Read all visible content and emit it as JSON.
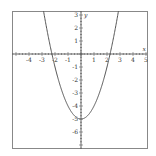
{
  "chart_data": {
    "type": "line",
    "title": "",
    "function": "y = x^2 - 5",
    "xlabel": "x",
    "ylabel": "y",
    "xlim": [
      -5.3,
      5.2
    ],
    "ylim": [
      -7.3,
      3.3
    ],
    "x_ticks": [
      "-4",
      "-3",
      "-2",
      "-1",
      "1",
      "2",
      "3",
      "4",
      "5"
    ],
    "y_ticks": [
      "3",
      "2",
      "1",
      "-1",
      "-2",
      "-3",
      "-4",
      "-5",
      "-6"
    ],
    "grid": false,
    "series": [
      {
        "name": "parabola",
        "x": [
          -2.83,
          -2.5,
          -2,
          -1.5,
          -1,
          -0.5,
          0,
          0.5,
          1,
          1.5,
          2,
          2.5,
          2.83
        ],
        "values": [
          3,
          1.25,
          -1,
          -2.75,
          -4,
          -4.75,
          -5,
          -4.75,
          -4,
          -2.75,
          -1,
          1.25,
          3
        ]
      }
    ],
    "colors": {
      "curve": "#555555",
      "axis": "#444444",
      "border": "#888888"
    }
  }
}
